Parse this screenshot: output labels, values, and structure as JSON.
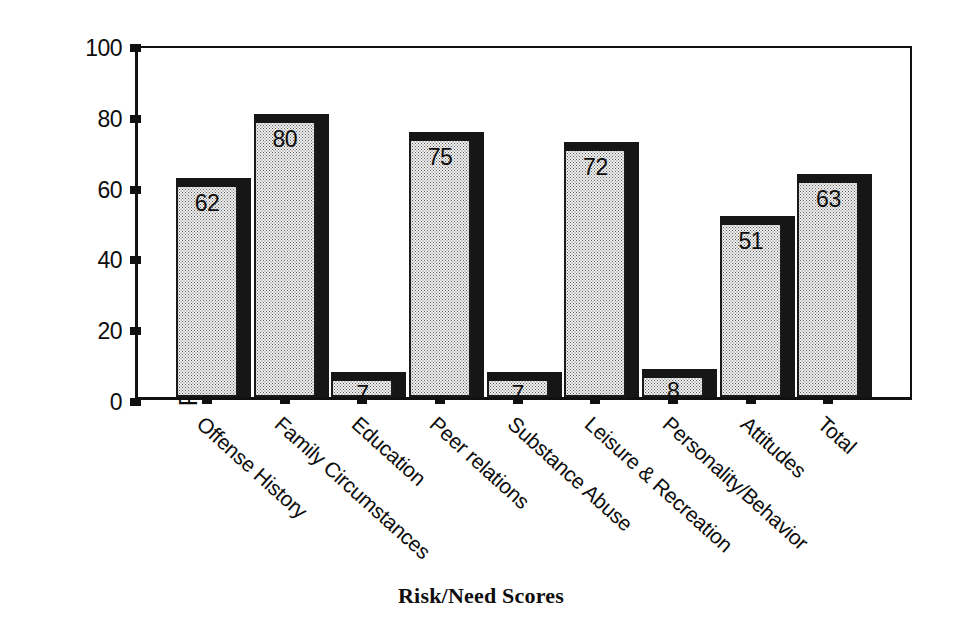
{
  "chart_data": {
    "type": "bar",
    "title": "",
    "xlabel": "Risk/Need Scores",
    "ylabel": "Percentile Score",
    "categories": [
      "Offense History",
      "Family Circumstances",
      "Education",
      "Peer relations",
      "Substance Abuse",
      "Leisure & Recreation",
      "Personality/Behavior",
      "Attitudes",
      "Total"
    ],
    "values": [
      62,
      80,
      7,
      75,
      7,
      72,
      8,
      51,
      63
    ],
    "value_labels": [
      "62",
      "80",
      "7",
      "75",
      "7",
      "72",
      "8",
      "51",
      "63"
    ],
    "ylim": [
      0,
      100
    ],
    "yticks": [
      0,
      20,
      40,
      60,
      80,
      100
    ],
    "ytick_labels": [
      "0",
      "20",
      "40",
      "60",
      "80",
      "100"
    ],
    "grid": false,
    "legend": null,
    "style": {
      "bar_face": "#f2f2f2",
      "bar_pattern": "stipple-dots",
      "bar_shadow": "#161616",
      "axis_color": "#111111",
      "background": "#ffffff",
      "three_d": true
    }
  }
}
